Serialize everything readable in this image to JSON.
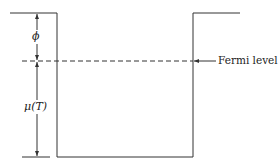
{
  "diagram": {
    "labels": {
      "phi": "ϕ",
      "mu": "μ(T)",
      "fermi": "Fermi level"
    },
    "colors": {
      "line": "#333333"
    }
  }
}
